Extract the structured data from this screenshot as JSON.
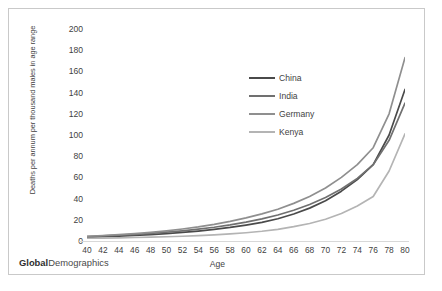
{
  "footer": {
    "bold_part": "Global",
    "rest": "Demographics"
  },
  "chart_data": {
    "type": "line",
    "title": "",
    "xlabel": "Age",
    "ylabel": "Deaths per annum per thousand males in age range",
    "xlim": [
      40,
      80
    ],
    "ylim": [
      0,
      200
    ],
    "ytick_step": 20,
    "xtick_step": 2,
    "grid": false,
    "legend_position": "inside-upper-right",
    "x": [
      40,
      42,
      44,
      46,
      48,
      50,
      52,
      54,
      56,
      58,
      60,
      62,
      64,
      66,
      68,
      70,
      72,
      74,
      76,
      78,
      80
    ],
    "xticks": [
      "40",
      "42",
      "44",
      "46",
      "48",
      "50",
      "52",
      "54",
      "56",
      "58",
      "60",
      "62",
      "64",
      "66",
      "68",
      "70",
      "72",
      "74",
      "76",
      "78",
      "80"
    ],
    "yticks": [
      "0",
      "20",
      "40",
      "60",
      "80",
      "100",
      "120",
      "140",
      "160",
      "180",
      "200"
    ],
    "series": [
      {
        "name": "China",
        "color": "#4a4a4a",
        "values": [
          3.5,
          4.0,
          4.6,
          5.3,
          6.1,
          7.0,
          8.1,
          9.4,
          11.0,
          12.8,
          15.0,
          17.5,
          21.0,
          25.5,
          31.0,
          38.0,
          47.0,
          58.0,
          72.0,
          100.0,
          143.0
        ]
      },
      {
        "name": "India",
        "color": "#707070",
        "values": [
          4.2,
          4.8,
          5.5,
          6.3,
          7.2,
          8.3,
          9.6,
          11.2,
          13.0,
          15.2,
          17.8,
          20.8,
          24.5,
          29.0,
          34.5,
          41.0,
          49.0,
          59.0,
          72.0,
          95.0,
          130.0
        ]
      },
      {
        "name": "Germany",
        "color": "#8f8f8f",
        "values": [
          4.5,
          5.2,
          6.0,
          7.0,
          8.2,
          9.6,
          11.3,
          13.3,
          15.7,
          18.5,
          21.8,
          25.6,
          30.0,
          35.5,
          42.0,
          50.0,
          60.0,
          72.0,
          88.0,
          120.0,
          173.0
        ]
      },
      {
        "name": "Kenya",
        "color": "#b4b4b4",
        "values": [
          2.6,
          2.8,
          3.0,
          3.3,
          3.6,
          4.0,
          4.5,
          5.1,
          5.8,
          6.7,
          7.8,
          9.2,
          11.0,
          13.5,
          16.5,
          20.5,
          26.0,
          33.0,
          42.0,
          66.0,
          101.0
        ]
      }
    ]
  }
}
